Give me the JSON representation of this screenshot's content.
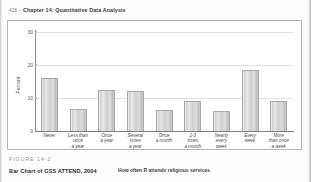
{
  "header": {
    "folio": "428",
    "bullet": "•",
    "chapter": "Chapter 14: Quantitative Data Analysis"
  },
  "figure": {
    "number": "FIGURE 14-2",
    "caption": "Bar Chart of GSS ATTEND, 2004"
  },
  "chart_data": {
    "type": "bar",
    "title": "",
    "xlabel": "How often R attends religious services",
    "ylabel": "Percent",
    "categories": [
      "Never",
      "Less than once a year",
      "Once a year",
      "Several times a year",
      "Once a month",
      "2-3 times a month",
      "Nearly every week",
      "Every week",
      "More than once a week"
    ],
    "category_lines": [
      [
        "Never"
      ],
      [
        "Less than",
        "once",
        "a year"
      ],
      [
        "Once",
        "a year"
      ],
      [
        "Several",
        "times",
        "a year"
      ],
      [
        "Once",
        "a month"
      ],
      [
        "2-3",
        "times",
        "a month"
      ],
      [
        "Nearly",
        "every",
        "week"
      ],
      [
        "Every",
        "week"
      ],
      [
        "More",
        "than once",
        "a week"
      ]
    ],
    "values": [
      16.0,
      6.8,
      12.5,
      12.0,
      6.5,
      9.0,
      6.0,
      18.5,
      9.0
    ],
    "ylim": [
      0,
      30
    ],
    "yticks": [
      0,
      10,
      20,
      30
    ],
    "ytick_labels": [
      "0",
      "10",
      "20",
      "30"
    ],
    "grid": true,
    "legend": "none",
    "bar_color": "#d3d3d3",
    "bar_border_color": "#a8a8a8",
    "axis_color": "#8e8e8e",
    "grid_color": "#e2e2e2"
  }
}
